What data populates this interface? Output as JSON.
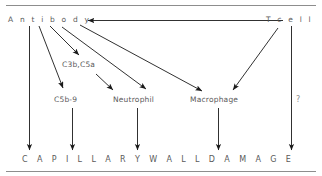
{
  "figure": {
    "title_text_bottom": "C A P I L L A R Y   W A L L   D A M A G E",
    "rules": {
      "top_rule": "horizontal-rule",
      "bottom_rule": "horizontal-rule"
    }
  },
  "nodes": {
    "antibody": {
      "label": "A n t i b o d y"
    },
    "tcell": {
      "label": "T  c e l l"
    },
    "c3b_c5a": {
      "label": "C3b,C5a"
    },
    "c5b_9": {
      "label": "C5b-9"
    },
    "neutrophil": {
      "label": "Neutrophil"
    },
    "macrophage": {
      "label": "Macrophage"
    },
    "unknown": {
      "label": "?"
    },
    "outcome": {
      "label": "C A P I L L A R Y  W A L L  D A M A G E"
    }
  },
  "colors": {
    "text": "#5a5a5a",
    "arrow": "#1a1a1a",
    "rule": "#8d8d8d",
    "background": "#ffffff"
  },
  "edges": [
    {
      "id": "tcell-to-antibody",
      "from": "T cell",
      "to": "Antibody",
      "kind": "horizontal-arrow-left"
    },
    {
      "id": "antibody-to-capillary",
      "from": "Antibody",
      "to": "CAPILLARY WALL DAMAGE",
      "kind": "vertical-arrow-down"
    },
    {
      "id": "antibody-to-c5b9",
      "from": "Antibody",
      "to": "C5b-9",
      "kind": "diagonal-arrow"
    },
    {
      "id": "antibody-to-c3b-c5a",
      "from": "Antibody",
      "to": "C3b,C5a",
      "kind": "diagonal-arrow"
    },
    {
      "id": "antibody-to-neutrophil",
      "from": "Antibody",
      "to": "Neutrophil",
      "kind": "diagonal-arrow"
    },
    {
      "id": "antibody-to-macrophage",
      "from": "Antibody",
      "to": "Macrophage",
      "kind": "diagonal-arrow"
    },
    {
      "id": "c3b-c5a-to-neutrophil",
      "from": "C3b,C5a",
      "to": "Neutrophil",
      "kind": "short-diagonal-arrow"
    },
    {
      "id": "tcell-to-macrophage",
      "from": "T cell",
      "to": "Macrophage",
      "kind": "diagonal-arrow"
    },
    {
      "id": "c5b9-to-capillary",
      "from": "C5b-9",
      "to": "CAPILLARY WALL DAMAGE",
      "kind": "vertical-arrow-down"
    },
    {
      "id": "neutrophil-to-capillary",
      "from": "Neutrophil",
      "to": "CAPILLARY WALL DAMAGE",
      "kind": "vertical-arrow-down"
    },
    {
      "id": "macrophage-to-capillary",
      "from": "Macrophage",
      "to": "CAPILLARY WALL DAMAGE",
      "kind": "vertical-arrow-down"
    },
    {
      "id": "tcell-unknown-to-capillary",
      "from": "T cell",
      "to": "CAPILLARY WALL DAMAGE",
      "kind": "vertical-arrow-down",
      "annotation": "?"
    }
  ]
}
